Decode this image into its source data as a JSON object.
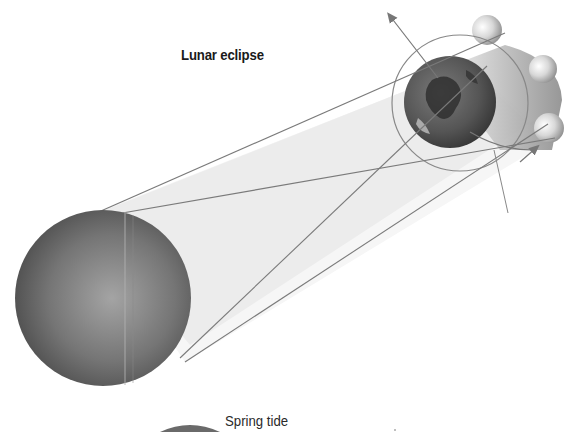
{
  "diagram": {
    "title": "Lunar eclipse",
    "caption_partial": "Spring tide",
    "elements": {
      "sun": "large grey sphere (lower left)",
      "earth": "globe (upper right)",
      "moon_positions": [
        "moon above earth",
        "moon right of earth (in shadow)",
        "moon below earth"
      ],
      "orbit": "circle around earth",
      "arrows": [
        "orbit direction arrow (upper left)",
        "orbit direction arrow (lower right)"
      ],
      "light_rays": [
        "outer tangent top",
        "outer tangent bottom",
        "inner crossing ray 1",
        "inner crossing ray 2"
      ]
    },
    "colors": {
      "background": "#ffffff",
      "ray_line": "#7a7a7a",
      "shadow_fill": "#e6e6e6",
      "sun_dark": "#4a4a4a",
      "sun_light": "#9a9a9a",
      "earth_dark": "#3c3c3c",
      "text": "#1a1a1a"
    }
  }
}
